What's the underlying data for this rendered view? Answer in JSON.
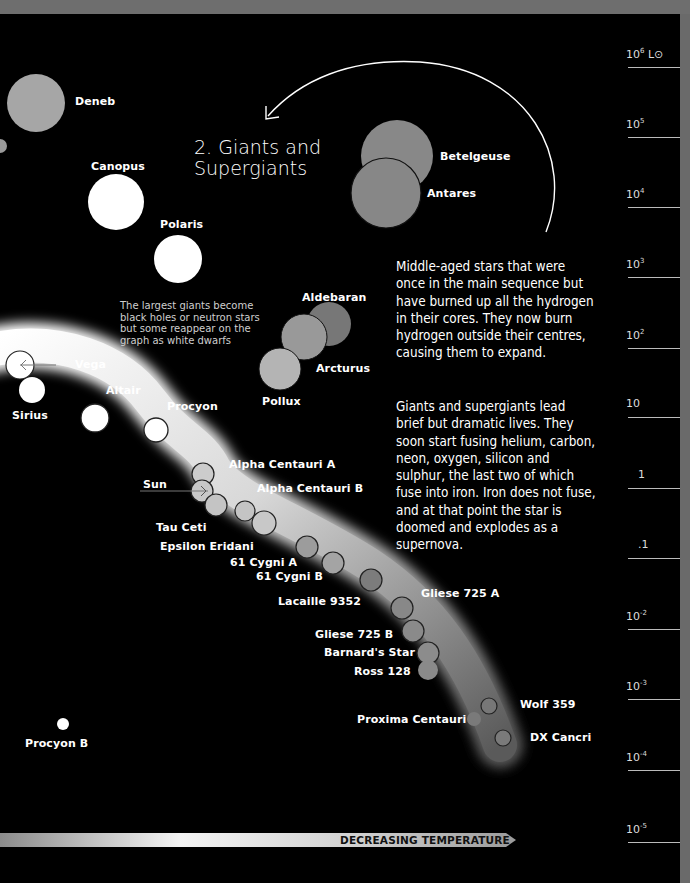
{
  "section": {
    "title_line1": "2. Giants and",
    "title_line2": "Supergiants"
  },
  "paragraphs": [
    "Middle-aged stars that were once in the main sequence but have burned up all the hydrogen in their cores. They now burn hydrogen outside their centres, causing them to expand.",
    "Giants and supergiants lead brief but dramatic lives. They soon start fusing helium, carbon, neon, oxygen, silicon and sulphur, the last two of which fuse into iron. Iron does not fuse, and at that point the star is doomed and explodes as a supernova."
  ],
  "note": "The largest giants become black holes or neutron stars but some reappear on the graph as white dwarfs",
  "axis": {
    "unit": "L⊙",
    "ticks": [
      {
        "base": "10",
        "exp": "6",
        "suffix": " L⊙"
      },
      {
        "base": "10",
        "exp": "5",
        "suffix": ""
      },
      {
        "base": "10",
        "exp": "4",
        "suffix": ""
      },
      {
        "base": "10",
        "exp": "3",
        "suffix": ""
      },
      {
        "base": "10",
        "exp": "2",
        "suffix": ""
      },
      {
        "base": "10",
        "exp": "",
        "suffix": ""
      },
      {
        "base": "1",
        "exp": "",
        "suffix": ""
      },
      {
        "base": ".1",
        "exp": "",
        "suffix": ""
      },
      {
        "base": "10",
        "exp": "-2",
        "suffix": ""
      },
      {
        "base": "10",
        "exp": "-3",
        "suffix": ""
      },
      {
        "base": "10",
        "exp": "-4",
        "suffix": ""
      },
      {
        "base": "10",
        "exp": "-5",
        "suffix": ""
      }
    ]
  },
  "temperature_arrow": {
    "label": "DECREASING TEMPERATURE"
  },
  "stars": {
    "deneb": "Deneb",
    "canopus": "Canopus",
    "polaris": "Polaris",
    "betelgeuse": "Betelgeuse",
    "antares": "Antares",
    "aldebaran": "Aldebaran",
    "arcturus": "Arcturus",
    "pollux": "Pollux",
    "vega": "Vega",
    "sirius": "Sirius",
    "altair": "Altair",
    "procyon": "Procyon",
    "alpha_cen_a": "Alpha Centauri A",
    "sun": "Sun",
    "alpha_cen_b": "Alpha Centauri B",
    "tau_ceti": "Tau Ceti",
    "epsilon_eridani": "Epsilon Eridani",
    "cygni_a": "61 Cygni A",
    "cygni_b": "61 Cygni B",
    "lacaille": "Lacaille 9352",
    "gliese_a": "Gliese 725 A",
    "gliese_b": "Gliese 725 B",
    "barnard": "Barnard's Star",
    "ross": "Ross 128",
    "wolf": "Wolf 359",
    "proxima": "Proxima Centauri",
    "dx_cancri": "DX Cancri",
    "procyon_b": "Procyon B"
  },
  "colors": {
    "background": "#000000",
    "band": "#e8e8e8",
    "supergiant": "#888888",
    "text": "#ffffff"
  }
}
